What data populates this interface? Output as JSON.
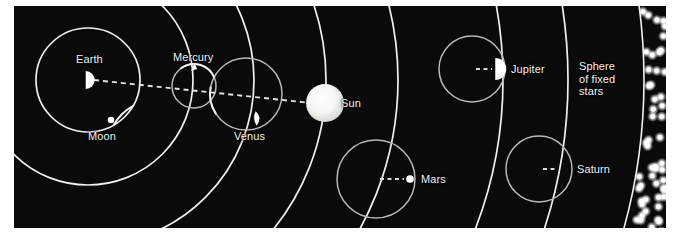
{
  "figure": {
    "background_color": "#0a0a0a",
    "line_color": "#f0f0f0",
    "epicycle_color": "#b9b9b9",
    "label_color": "#f2f2f2",
    "body_color": "#ffffff",
    "sun_color": "#fdfdfd",
    "star_color": "#ffffff",
    "frame": {
      "x": 14,
      "y": 6,
      "width": 652,
      "height": 222
    }
  },
  "center": {
    "name": "Earth",
    "x": 74,
    "y": 74
  },
  "labels": {
    "earth": "Earth",
    "moon": "Moon",
    "mercury": "Mercury",
    "venus": "Venus",
    "sun": "Sun",
    "mars": "Mars",
    "jupiter": "Jupiter",
    "saturn": "Sphere of\nfixed stars",
    "saturn_planet": "Saturn",
    "fixed_stars": "Sphere\nof fixed\nstars"
  },
  "bodies": [
    {
      "id": "earth",
      "label": "Earth",
      "glyph": "half-disc",
      "x": 74,
      "y": 74,
      "size": 9,
      "label_x": 62,
      "label_y": 47,
      "deferent_radius": 0,
      "epicycle_radius": 0
    },
    {
      "id": "moon",
      "label": "Moon",
      "glyph": "small-disc",
      "x": 97,
      "y": 114,
      "size": 6,
      "label_x": 74,
      "label_y": 124,
      "deferent_radius": 52,
      "epicycle_radius": 0,
      "arc": true
    },
    {
      "id": "mercury",
      "label": "Mercury",
      "glyph": "arrow-tip",
      "x": 180,
      "y": 61,
      "size": 7,
      "label_x": 159,
      "label_y": 45,
      "deferent_radius": 105,
      "epicycle_radius": 22,
      "epicycle_cx": 180,
      "epicycle_cy": 80
    },
    {
      "id": "venus",
      "label": "Venus",
      "glyph": "crescent-sliver",
      "x": 243,
      "y": 113,
      "size": 9,
      "label_x": 220,
      "label_y": 124,
      "deferent_radius": 166,
      "epicycle_radius": 36,
      "epicycle_cx": 232,
      "epicycle_cy": 88
    },
    {
      "id": "sun",
      "label": "Sun",
      "glyph": "disc",
      "x": 311,
      "y": 97,
      "size": 19,
      "label_x": 327,
      "label_y": 91,
      "deferent_radius": 238,
      "epicycle_radius": 0
    },
    {
      "id": "mars",
      "label": "Mars",
      "glyph": "small-disc",
      "x": 396,
      "y": 173,
      "size": 7,
      "label_x": 407,
      "label_y": 167,
      "deferent_radius": 310,
      "epicycle_radius": 39,
      "epicycle_cx": 362,
      "epicycle_cy": 173
    },
    {
      "id": "jupiter",
      "label": "Jupiter",
      "glyph": "half-disc",
      "x": 484,
      "y": 63,
      "size": 11,
      "label_x": 497,
      "label_y": 57,
      "deferent_radius": 415,
      "epicycle_radius": 33,
      "epicycle_cx": 458,
      "epicycle_cy": 63
    },
    {
      "id": "saturn",
      "label": "Saturn",
      "glyph": "crescent",
      "x": 548,
      "y": 163,
      "size": 12,
      "label_x": 563,
      "label_y": 157,
      "deferent_radius": 480,
      "epicycle_radius": 33,
      "epicycle_cx": 525,
      "epicycle_cy": 163
    }
  ],
  "fixed_stars": {
    "label": "Sphere\nof fixed\nstars",
    "label_x": 565,
    "label_y": 54,
    "band_inner_radius": 556,
    "band_outer_radius": 610,
    "star_count": 54,
    "star_radius": 2.4
  },
  "deferents": [
    {
      "id": "moon-orbit",
      "radius": 52
    },
    {
      "id": "mercury-deferent",
      "radius": 105
    },
    {
      "id": "venus-deferent",
      "radius": 166
    },
    {
      "id": "sun-deferent",
      "radius": 238
    },
    {
      "id": "mars-deferent",
      "radius": 310
    },
    {
      "id": "jupiter-deferent",
      "radius": 415
    },
    {
      "id": "saturn-deferent",
      "radius": 480
    },
    {
      "id": "stars-inner",
      "radius": 556
    },
    {
      "id": "stars-outer",
      "radius": 610
    }
  ],
  "radial_line": {
    "id": "earth-sun-sightline",
    "dashed": true,
    "from": {
      "x": 74,
      "y": 74
    },
    "to": {
      "x": 311,
      "y": 97
    }
  }
}
